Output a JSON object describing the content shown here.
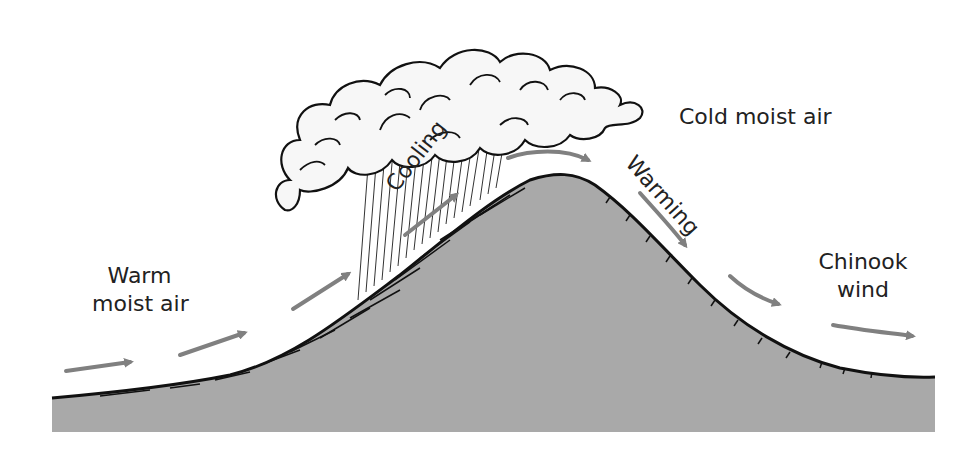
{
  "diagram": {
    "labels": {
      "warm_line1": "Warm",
      "warm_line2": "moist air",
      "cooling": "Cooling",
      "cold": "Cold moist air",
      "warming": "Warming",
      "chinook_line1": "Chinook",
      "chinook_line2": "wind"
    },
    "colors": {
      "mountain_fill": "#a9a9a9",
      "outline": "#111111",
      "arrow": "#808080",
      "cloud_fill": "#f7f7f7",
      "text": "#222222",
      "background": "#ffffff"
    }
  }
}
